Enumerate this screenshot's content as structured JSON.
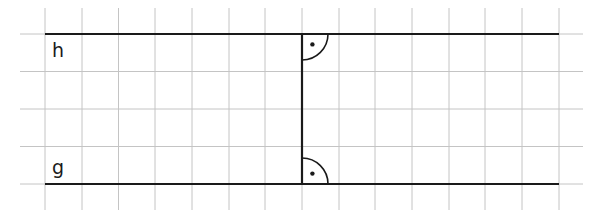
{
  "diagram": {
    "labels": {
      "top_line": "h",
      "bottom_line": "g"
    },
    "grid": {
      "columns_x": [
        45,
        82,
        118.5,
        155,
        192,
        229,
        265,
        302,
        339,
        375,
        412,
        449,
        485,
        522,
        559
      ],
      "rows_y": [
        34,
        71.5,
        109,
        146.5,
        184
      ],
      "x_extent": [
        20,
        583
      ],
      "y_extent": [
        8,
        210
      ],
      "color": "#c4c4c4"
    },
    "lines": {
      "h": {
        "x1": 45,
        "x2": 559,
        "y": 34
      },
      "g": {
        "x1": 45,
        "x2": 559,
        "y": 184
      },
      "perpendicular": {
        "x": 302,
        "y1": 34,
        "y2": 184
      }
    },
    "right_angle_markers": [
      {
        "at": "h",
        "cx": 302,
        "cy": 34,
        "radius": 26,
        "direction": "down-right"
      },
      {
        "at": "g",
        "cx": 302,
        "cy": 184,
        "radius": 26,
        "direction": "up-right"
      }
    ],
    "colors": {
      "line": "#1a1a1a",
      "grid": "#c4c4c4"
    }
  }
}
